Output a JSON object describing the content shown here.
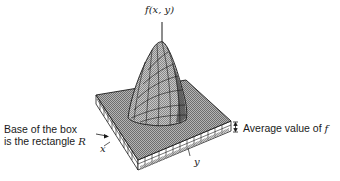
{
  "figure": {
    "axis_label_top": "f(x, y)",
    "axis_label_x": "x",
    "axis_label_y": "y",
    "annotation_base_line1": "Base of the box",
    "annotation_base_line2_prefix": "is the rectangle ",
    "annotation_base_line2_symbol": "R",
    "annotation_avg_prefix": "Average value of ",
    "annotation_avg_symbol": "f"
  },
  "colors": {
    "ink": "#1a1a1a",
    "surface_fill": "#9a9a9a",
    "box_top": "#8c8c8c",
    "background": "#ffffff"
  }
}
